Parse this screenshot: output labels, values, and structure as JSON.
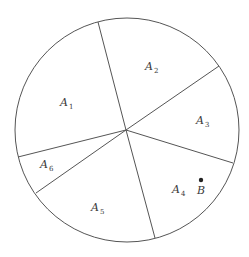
{
  "diagram": {
    "circle": {
      "cx": 127,
      "cy": 130,
      "r": 112,
      "stroke": "#555555"
    },
    "center": {
      "x": 126,
      "y": 130
    },
    "spokes": [
      {
        "name": "spoke-a1-a2",
        "x": 98,
        "y": 22
      },
      {
        "name": "spoke-a2-a3",
        "x": 219,
        "y": 66
      },
      {
        "name": "spoke-a3-a4",
        "x": 233,
        "y": 163
      },
      {
        "name": "spoke-a4-a5",
        "x": 155,
        "y": 238
      },
      {
        "name": "spoke-a5-a6",
        "x": 36,
        "y": 193
      },
      {
        "name": "spoke-a6-a1",
        "x": 18,
        "y": 157
      }
    ],
    "regions": [
      {
        "main": "A",
        "sub": "1",
        "x": 60,
        "y": 106
      },
      {
        "main": "A",
        "sub": "2",
        "x": 145,
        "y": 70
      },
      {
        "main": "A",
        "sub": "3",
        "x": 196,
        "y": 124
      },
      {
        "main": "A",
        "sub": "4",
        "x": 172,
        "y": 193
      },
      {
        "main": "A",
        "sub": "5",
        "x": 91,
        "y": 211
      },
      {
        "main": "A",
        "sub": "6",
        "x": 40,
        "y": 168
      }
    ],
    "point": {
      "label": "B",
      "dot_x": 201,
      "dot_y": 180,
      "label_x": 197,
      "label_y": 194
    }
  }
}
